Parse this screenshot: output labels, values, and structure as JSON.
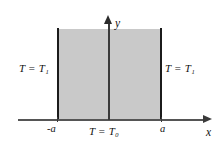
{
  "figure": {
    "background_color": "#ffffff",
    "region_fill_color": "#c9c9c9",
    "wall_color": "#1b1b1b",
    "axis_color": "#3a3a3a"
  },
  "axes": {
    "x_label": "x",
    "y_label": "y",
    "x_arrow": "arrow-right",
    "y_arrow": "arrow-up"
  },
  "ticks": {
    "left": "-a",
    "right": "a"
  },
  "boundary_conditions": {
    "left": "T = T₁",
    "right": "T = T₁",
    "bottom": "T = T₀"
  },
  "chart_data": {
    "type": "diagram",
    "title": "",
    "xlabel": "x",
    "ylabel": "y",
    "region": {
      "name": "semi-infinite strip",
      "x_min": -1,
      "x_max": 1,
      "y_min": 0,
      "y_max": "infinity",
      "fill": "#c9c9c9"
    },
    "xticks": [
      -1,
      1
    ],
    "xticklabels": [
      "-a",
      "a"
    ],
    "annotations": [
      {
        "text": "T = T₁",
        "location": "left-boundary",
        "x": -1
      },
      {
        "text": "T = T₁",
        "location": "right-boundary",
        "x": 1
      },
      {
        "text": "T = T₀",
        "location": "bottom-boundary",
        "y": 0
      }
    ],
    "grid": false,
    "legend": false
  }
}
